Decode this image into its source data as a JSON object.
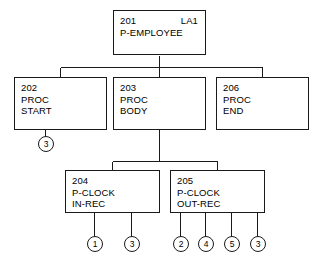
{
  "diagram": {
    "type": "structure-chart",
    "nodes": [
      {
        "id": "201",
        "label": "LA1",
        "line2": "P-EMPLOYEE",
        "line3": ""
      },
      {
        "id": "202",
        "label": "",
        "line2": "PROC",
        "line3": "START"
      },
      {
        "id": "203",
        "label": "",
        "line2": "PROC",
        "line3": "BODY"
      },
      {
        "id": "206",
        "label": "",
        "line2": "PROC",
        "line3": "END"
      },
      {
        "id": "204",
        "label": "",
        "line2": "P-CLOCK",
        "line3": "IN-REC"
      },
      {
        "id": "205",
        "label": "",
        "line2": "P-CLOCK",
        "line3": "OUT-REC"
      }
    ],
    "connectors": [
      {
        "ref": "3",
        "parent": "202"
      },
      {
        "ref": "1",
        "parent": "204"
      },
      {
        "ref": "3",
        "parent": "204"
      },
      {
        "ref": "2",
        "parent": "205"
      },
      {
        "ref": "4",
        "parent": "205"
      },
      {
        "ref": "5",
        "parent": "205"
      },
      {
        "ref": "3",
        "parent": "205"
      }
    ],
    "colors": {
      "line": "#1a1a1a",
      "background": "#ffffff",
      "text": "#000000"
    }
  }
}
